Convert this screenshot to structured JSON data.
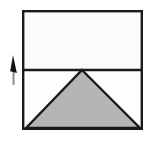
{
  "figure": {
    "canvas": {
      "width": 161,
      "height": 141,
      "background": "#ffffff"
    },
    "colors": {
      "stroke": "#1a1a1a",
      "upper_fill": "#fbfbfb",
      "lower_fill": "#fdfdfd",
      "triangle_fill": "#b5b5b5",
      "arrow_head": "#141414",
      "arrow_stem": "#8d8d8d"
    },
    "shapes": {
      "square": {
        "name": "outer-square",
        "x": 22,
        "y": 10,
        "width": 121,
        "height": 120,
        "stroke_width": 2.4
      },
      "divider": {
        "name": "horizontal-divider",
        "x1": 22,
        "y1": 70,
        "x2": 143,
        "y2": 70,
        "stroke_width": 2.4,
        "fraction_of_height": 0.5
      },
      "triangle": {
        "name": "shaded-triangle",
        "apex_x": 82,
        "apex_y": 70,
        "base_left_x": 26,
        "base_right_x": 140,
        "base_y": 128,
        "stroke_width": 2.4
      },
      "arrow": {
        "name": "up-arrow",
        "direction": "up",
        "tip_x": 13,
        "tip_y": 55,
        "tail_x": 13,
        "tail_y": 85,
        "head_width": 7,
        "head_length": 17,
        "stem_width": 2
      }
    },
    "labels": {
      "square": "",
      "triangle": "",
      "arrow": ""
    }
  }
}
